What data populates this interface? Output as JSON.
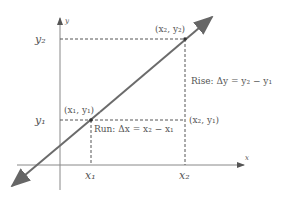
{
  "diagram": {
    "axes": {
      "x_label": "x",
      "y_label": "y"
    },
    "points": {
      "p1": "(x₁, y₁)",
      "p2": "(x₂, y₂)",
      "corner": "(x₂, y₁)"
    },
    "ticks": {
      "x1": "x₁",
      "x2": "x₂",
      "y1": "y₁",
      "y2": "y₂"
    },
    "annotations": {
      "rise": "Rise: Δy = y₂ − y₁",
      "run": "Run: Δx = x₂ − x₁"
    },
    "colors": {
      "line": "#6b6b6b",
      "axis": "#888888",
      "dash": "#555555",
      "text": "#555555"
    }
  }
}
